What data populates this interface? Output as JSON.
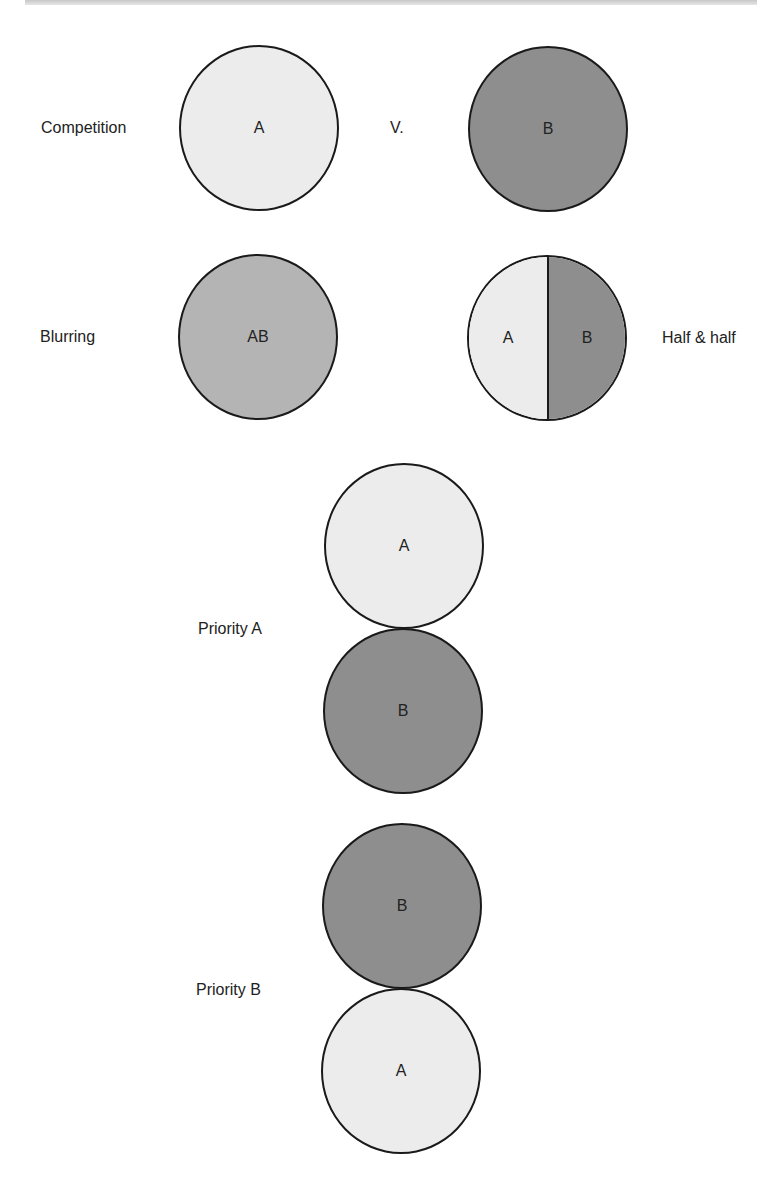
{
  "colors": {
    "a_fill": "#ececec",
    "b_fill": "#8e8e8e",
    "ab_fill": "#b4b4b4",
    "outline": "#1a1a1a",
    "text": "#222222"
  },
  "rows": {
    "competition": {
      "label": "Competition",
      "versus": "V.",
      "circle_a": "A",
      "circle_b": "B"
    },
    "blurring": {
      "label": "Blurring",
      "circle_ab": "AB"
    },
    "half_and_half": {
      "label": "Half & half",
      "left": "A",
      "right": "B"
    },
    "priority_a": {
      "label": "Priority A",
      "top": "A",
      "bottom": "B"
    },
    "priority_b": {
      "label": "Priority B",
      "top": "B",
      "bottom": "A"
    }
  }
}
